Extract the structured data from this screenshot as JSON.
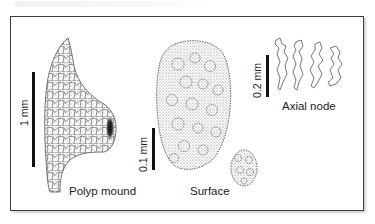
{
  "figure": {
    "caption_blurred": "",
    "panels": [
      {
        "id": "polyp-mound",
        "label": "Polyp mound",
        "scale_bar": {
          "label": "1 mm"
        }
      },
      {
        "id": "surface",
        "label": "Surface",
        "scale_bar": {
          "label": "0.1 mm"
        }
      },
      {
        "id": "axial-node",
        "label": "Axial node",
        "scale_bar": {
          "label": "0.2 mm"
        }
      }
    ],
    "colors": {
      "frame": "#3c3c3c",
      "ink": "#222222",
      "stipple": "#6e6e6e"
    }
  }
}
